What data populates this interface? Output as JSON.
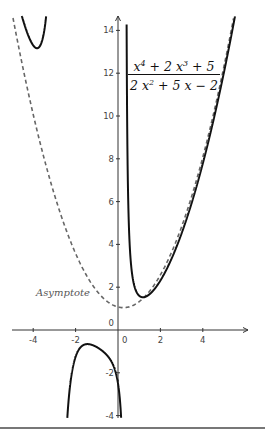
{
  "chart_data": {
    "type": "line",
    "title": "",
    "function_label": {
      "numerator": [
        "x",
        "4",
        " + 2 ",
        "x",
        "3",
        " + 5"
      ],
      "denominator": [
        "2 ",
        "x",
        "2",
        " + 5 ",
        "x",
        " − 2"
      ]
    },
    "function": "(x^4 + 2x^3 + 5) / (2x^2 + 5x - 2)",
    "asymptote_label": "Asymptote",
    "asymptote": "x^2/2 - x/4 + 13/8",
    "series": [
      {
        "name": "f(x)",
        "style": "solid",
        "color": "#111111"
      },
      {
        "name": "Asymptote",
        "style": "dashed",
        "color": "#666666"
      }
    ],
    "x_ticks": [
      -4,
      -2,
      0,
      2,
      4
    ],
    "x_tick_labels": [
      "-4",
      "-2",
      "0",
      "2",
      "4"
    ],
    "y_ticks": [
      -4,
      -2,
      0,
      2,
      4,
      6,
      8,
      10,
      12,
      14
    ],
    "y_tick_labels": [
      "-4",
      "-2",
      "0",
      "2",
      "4",
      "6",
      "8",
      "10",
      "12",
      "14"
    ],
    "xlim": [
      -5.5,
      5.8
    ],
    "ylim": [
      -4.2,
      14.6
    ],
    "grid": false,
    "origin_label": "0"
  }
}
